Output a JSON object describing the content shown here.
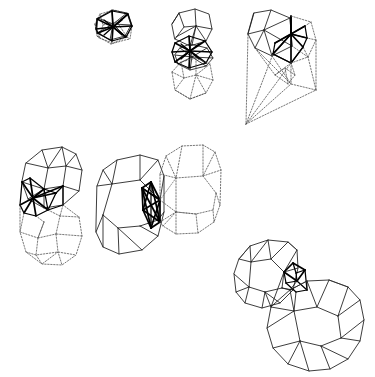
{
  "page": {
    "background_color": "#ffffff",
    "width": 375,
    "height": 377,
    "stroke_color": "#1a1a1a",
    "ghost_stroke_color": "#4a4a4a",
    "heavy_stroke_color": "#000000",
    "caption": ""
  },
  "legend": {
    "solid_label": "solid outline",
    "ghost_label": "dotted ghost copy",
    "heavy_label": "emphasized core"
  },
  "figures": [
    {
      "id": "fig-1",
      "name": "small-star-cell",
      "label": "",
      "row": "top",
      "column": 1,
      "has_ghost": true,
      "has_heavy_core": true,
      "core_type": "star-burst",
      "origin_x": 88,
      "origin_y": 8
    },
    {
      "id": "fig-2",
      "name": "rhombic-cell-pair",
      "label": "",
      "row": "top",
      "column": 2,
      "has_ghost": true,
      "has_heavy_core": true,
      "core_type": "star-burst",
      "origin_x": 163,
      "origin_y": 8
    },
    {
      "id": "fig-3",
      "name": "wedge-cone-cell",
      "label": "",
      "row": "top",
      "column": 3,
      "has_ghost": true,
      "has_heavy_core": true,
      "core_type": "tetrahedral-fan",
      "origin_x": 240,
      "origin_y": 8
    },
    {
      "id": "fig-4",
      "name": "rhombic-dodecahedron-pair",
      "label": "",
      "row": "middle",
      "column": 1,
      "has_ghost": true,
      "has_heavy_core": true,
      "core_type": "star-burst",
      "origin_x": 12,
      "origin_y": 140
    },
    {
      "id": "fig-5",
      "name": "truncated-octahedron-pair",
      "label": "",
      "row": "middle",
      "column": 2,
      "has_ghost": true,
      "has_heavy_core": true,
      "core_type": "octahedron",
      "origin_x": 92,
      "origin_y": 145
    },
    {
      "id": "fig-6",
      "name": "truncated-cuboctahedron-pair",
      "label": "",
      "row": "bottom",
      "column": 3,
      "has_ghost": false,
      "has_heavy_core": true,
      "core_type": "cube",
      "origin_x": 210,
      "origin_y": 235
    }
  ]
}
